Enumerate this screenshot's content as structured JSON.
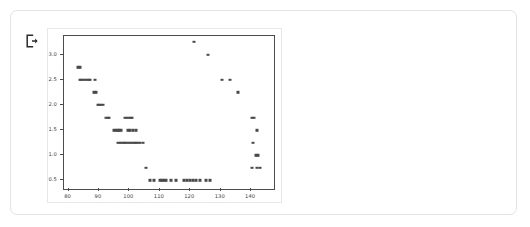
{
  "card": {
    "icon": "exit-icon",
    "icon_name": "logout-exit-icon"
  },
  "chart_data": {
    "type": "scatter",
    "title": "",
    "xlabel": "",
    "ylabel": "",
    "xlim": [
      78.5,
      147.5
    ],
    "ylim": [
      0.33,
      3.37
    ],
    "xticks": [
      80,
      90,
      100,
      110,
      120,
      130,
      140
    ],
    "yticks": [
      0.5,
      1.0,
      1.5,
      2.0,
      2.5,
      3.0
    ],
    "xtick_labels": [
      "80",
      "90",
      "100",
      "110",
      "120",
      "130",
      "140"
    ],
    "ytick_labels": [
      "0.5",
      "1.0",
      "1.5",
      "2.0",
      "2.5",
      "3.0"
    ],
    "grid": false,
    "legend": null,
    "marker_color": "#4a4a4a",
    "marker_size": 3,
    "frame_color": "#4c4c4c",
    "background": "#ffffff",
    "points": [
      [
        83.2,
        2.75
      ],
      [
        83.8,
        2.75
      ],
      [
        83.6,
        2.5
      ],
      [
        84.2,
        2.5
      ],
      [
        84.8,
        2.5
      ],
      [
        85.4,
        2.5
      ],
      [
        86.0,
        2.5
      ],
      [
        86.6,
        2.5
      ],
      [
        87.2,
        2.5
      ],
      [
        88.8,
        2.5
      ],
      [
        88.4,
        2.25
      ],
      [
        88.9,
        2.25
      ],
      [
        89.6,
        2.0
      ],
      [
        90.1,
        2.0
      ],
      [
        90.7,
        2.0
      ],
      [
        91.3,
        2.0
      ],
      [
        92.3,
        1.75
      ],
      [
        92.9,
        1.75
      ],
      [
        93.4,
        1.75
      ],
      [
        98.6,
        1.75
      ],
      [
        99.2,
        1.75
      ],
      [
        99.8,
        1.75
      ],
      [
        100.4,
        1.75
      ],
      [
        101.0,
        1.75
      ],
      [
        94.9,
        1.5
      ],
      [
        95.5,
        1.5
      ],
      [
        96.1,
        1.5
      ],
      [
        96.7,
        1.5
      ],
      [
        97.3,
        1.5
      ],
      [
        99.5,
        1.5
      ],
      [
        100.1,
        1.5
      ],
      [
        101.3,
        1.5
      ],
      [
        102.0,
        1.5
      ],
      [
        96.3,
        1.25
      ],
      [
        96.9,
        1.25
      ],
      [
        97.5,
        1.25
      ],
      [
        98.1,
        1.25
      ],
      [
        98.7,
        1.25
      ],
      [
        99.3,
        1.25
      ],
      [
        99.9,
        1.25
      ],
      [
        100.5,
        1.25
      ],
      [
        101.1,
        1.25
      ],
      [
        101.7,
        1.25
      ],
      [
        102.3,
        1.25
      ],
      [
        102.9,
        1.25
      ],
      [
        103.5,
        1.25
      ],
      [
        104.6,
        1.25
      ],
      [
        105.4,
        0.75
      ],
      [
        106.6,
        0.5
      ],
      [
        108.0,
        0.5
      ],
      [
        110.0,
        0.5
      ],
      [
        110.7,
        0.5
      ],
      [
        111.4,
        0.5
      ],
      [
        112.1,
        0.5
      ],
      [
        113.6,
        0.5
      ],
      [
        115.4,
        0.5
      ],
      [
        117.8,
        0.5
      ],
      [
        118.8,
        0.5
      ],
      [
        119.8,
        0.5
      ],
      [
        120.8,
        0.5
      ],
      [
        121.8,
        0.5
      ],
      [
        123.2,
        0.5
      ],
      [
        125.0,
        0.5
      ],
      [
        126.6,
        0.5
      ],
      [
        121.3,
        3.25
      ],
      [
        125.8,
        3.0
      ],
      [
        130.5,
        2.5
      ],
      [
        133.2,
        2.5
      ],
      [
        135.8,
        2.25
      ],
      [
        140.3,
        1.75
      ],
      [
        140.9,
        1.75
      ],
      [
        141.9,
        1.5
      ],
      [
        140.6,
        1.25
      ],
      [
        141.5,
        1.0
      ],
      [
        142.3,
        1.0
      ],
      [
        140.2,
        0.75
      ],
      [
        142.0,
        0.75
      ],
      [
        142.9,
        0.75
      ]
    ]
  }
}
